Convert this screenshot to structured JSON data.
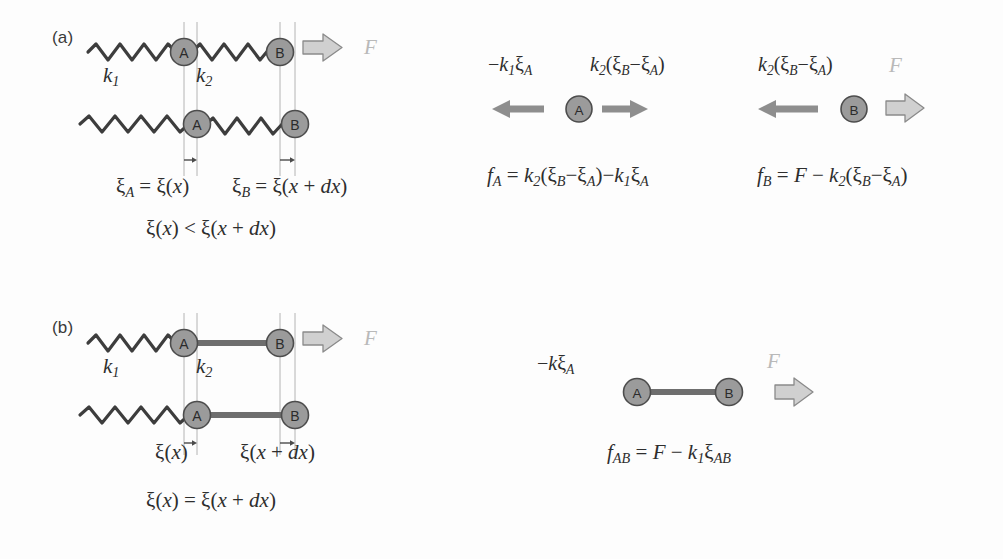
{
  "figure": {
    "background": "#fdfdfd",
    "ball_fill": "#9b9b9b",
    "ball_stroke": "#4d4d4d",
    "spring_color": "#3d3d3d",
    "rod_color": "#6e6e6e",
    "solid_arrow_color": "#8e8e8e",
    "outline_arrow_fill": "#d0d0d0",
    "outline_arrow_stroke": "#8a8a8a",
    "guide_line_color": "#b4b4b4",
    "force_label_color": "#b9b9b9",
    "text_color": "#2e2e2e"
  },
  "panel_a": {
    "label": "(a)",
    "spring1_label": "k",
    "spring1_sub": "1",
    "spring2_label": "k",
    "spring2_sub": "2",
    "force_label": "F",
    "ball_a": "A",
    "ball_b": "B",
    "caption_xi_a": "ξ_A = ξ(x)",
    "caption_xi_b": "ξ_B = ξ(x + dx)",
    "caption_relation": "ξ(x) < ξ(x + dx)",
    "free_body_a": {
      "left_force_label": "−k₁ξ_A",
      "right_force_label": "k₂(ξ_B−ξ_A)",
      "ball": "A",
      "equation": "f_A = k₂(ξ_B−ξ_A)−k₁ξ_A"
    },
    "free_body_b": {
      "left_force_label": "k₂(ξ_B−ξ_A)",
      "right_force_label": "F",
      "ball": "B",
      "equation": "f_B = F − k₂(ξ_B−ξ_A)"
    }
  },
  "panel_b": {
    "label": "(b)",
    "spring1_label": "k",
    "spring1_sub": "1",
    "rod_label": "k",
    "rod_sub": "2",
    "force_label": "F",
    "ball_a": "A",
    "ball_b": "B",
    "caption_xi_a": "ξ(x)",
    "caption_xi_b": "ξ(x + dx)",
    "caption_relation": "ξ(x) = ξ(x + dx)",
    "free_body_ab": {
      "left_force_label": "−kξ_A",
      "right_force_label": "F",
      "ball_a": "A",
      "ball_b": "B",
      "equation": "f_AB = F − k₁ξ_AB"
    }
  }
}
